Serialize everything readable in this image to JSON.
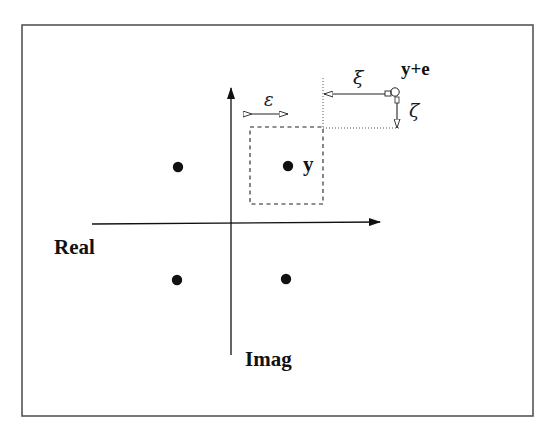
{
  "diagram": {
    "type": "complex-plane constellation with perturbation",
    "frame": {
      "x": 22,
      "y": 25,
      "width": 511,
      "height": 391,
      "stroke": "#555555"
    },
    "axes": {
      "real": {
        "label": "Real",
        "x1": 92,
        "y1": 224,
        "x2": 380,
        "y2": 222
      },
      "imag": {
        "label": "Imag",
        "x1": 231,
        "y1": 355,
        "x2": 231,
        "y2": 88
      }
    },
    "points": [
      {
        "id": "p1",
        "x": 178,
        "y": 167,
        "label": ""
      },
      {
        "id": "y",
        "x": 288,
        "y": 166,
        "label": "y"
      },
      {
        "id": "p3",
        "x": 177,
        "y": 280,
        "label": ""
      },
      {
        "id": "p4",
        "x": 286,
        "y": 279,
        "label": ""
      }
    ],
    "epsilon_box": {
      "x": 250,
      "y": 127,
      "width": 73,
      "height": 77,
      "style": "dashed"
    },
    "epsilon": {
      "symbol": "ε",
      "arrow": {
        "x1": 250,
        "x2": 289,
        "y": 114
      }
    },
    "perturbed_point": {
      "label": "y+e",
      "x": 395,
      "y": 92,
      "radius": 4
    },
    "xi": {
      "symbol": "ξ",
      "arrow": {
        "x1": 323,
        "x2": 391,
        "y": 94
      }
    },
    "zeta": {
      "symbol": "ζ",
      "arrow": {
        "x": 397,
        "y1": 97,
        "y2": 128
      }
    },
    "guides": {
      "vertical_dotted": {
        "x": 323,
        "y1": 78,
        "y2": 127
      },
      "horizontal_dotted": {
        "x1": 323,
        "x2": 399,
        "y": 128
      }
    },
    "colors": {
      "ink": "#111111",
      "frame": "#555555",
      "background": "#ffffff"
    }
  }
}
